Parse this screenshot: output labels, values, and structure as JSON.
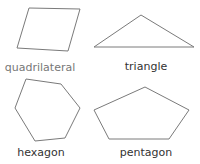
{
  "colors": {
    "stroke": "#7a7a7a",
    "label_dark": "#333333",
    "label_light": "#777777",
    "background": "#ffffff"
  },
  "shapes": [
    {
      "name": "quadrilateral",
      "label": "quadrilateral",
      "points": "29,8 80,9 68,51 17,48",
      "label_x": 40,
      "label_y": 62,
      "muted": true
    },
    {
      "name": "triangle",
      "label": "triangle",
      "points": "141,15 94,47 194,47",
      "label_x": 146,
      "label_y": 61,
      "muted": false
    },
    {
      "name": "hexagon",
      "label": "hexagon",
      "points": "26,79 61,84 80,108 65,138 35,141 15,108",
      "label_x": 41,
      "label_y": 147,
      "muted": false
    },
    {
      "name": "pentagon",
      "label": "pentagon",
      "points": "145,87 189,110 169,139 109,139 94,110",
      "label_x": 146,
      "label_y": 147,
      "muted": false
    }
  ]
}
